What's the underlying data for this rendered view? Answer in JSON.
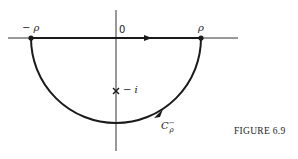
{
  "figure": {
    "caption": "FIGURE 6.9",
    "labels": {
      "neg_rho": "− ρ",
      "origin": "0",
      "rho": "ρ",
      "neg_i": "− i",
      "contour_base": "C",
      "contour_sub": "ρ",
      "contour_sup": "−"
    },
    "geometry": {
      "center": [
        116,
        38
      ],
      "radius": 85,
      "pole_marker": "x-mark",
      "pole_position": [
        116,
        91
      ]
    },
    "colors": {
      "stroke": "#1a1a1a",
      "axis": "#333333",
      "background": "#ffffff"
    }
  }
}
